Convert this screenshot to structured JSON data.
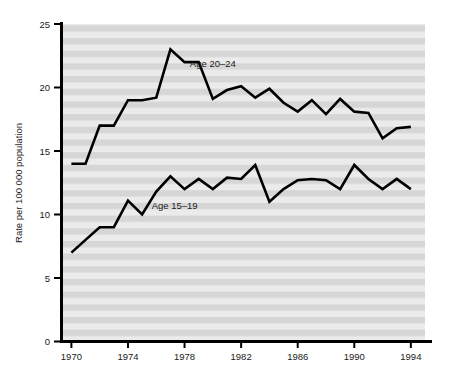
{
  "chart_data": {
    "type": "line",
    "title": "",
    "xlabel": "",
    "ylabel": "Rate per 100 000 population",
    "xlim": [
      1969.3,
      1995.0
    ],
    "ylim": [
      0,
      25
    ],
    "xticks": [
      1970,
      1974,
      1978,
      1982,
      1986,
      1990,
      1994
    ],
    "xtick_labels": [
      "1970",
      "1974",
      "1978",
      "1982",
      "1986",
      "1990",
      "1994"
    ],
    "yticks": [
      0,
      5,
      10,
      15,
      20,
      25
    ],
    "ytick_labels": [
      "0",
      "5",
      "10",
      "15",
      "20",
      "25"
    ],
    "grid": false,
    "background_stripes": true,
    "legend_position": "inline-annotation",
    "x": [
      1970,
      1971,
      1972,
      1973,
      1974,
      1975,
      1976,
      1977,
      1978,
      1979,
      1980,
      1981,
      1982,
      1983,
      1984,
      1985,
      1986,
      1987,
      1988,
      1989,
      1990,
      1991,
      1992,
      1993,
      1994
    ],
    "series": [
      {
        "name": "Age 20–24",
        "label": "Age 20–24",
        "color": "#000000",
        "label_x": 1980.0,
        "label_y": 21.6,
        "values": [
          14.0,
          14.0,
          17.0,
          17.0,
          19.0,
          19.0,
          19.2,
          23.0,
          22.0,
          22.0,
          19.1,
          19.8,
          20.1,
          19.2,
          19.9,
          18.8,
          18.1,
          19.0,
          17.9,
          19.1,
          18.1,
          18.0,
          16.0,
          16.8,
          16.9
        ]
      },
      {
        "name": "Age 15–19",
        "label": "Age 15–19",
        "color": "#000000",
        "label_x": 1977.3,
        "label_y": 10.4,
        "values": [
          7.0,
          8.0,
          9.0,
          9.0,
          11.1,
          10.0,
          11.8,
          13.0,
          12.0,
          12.8,
          12.0,
          12.9,
          12.8,
          13.9,
          11.0,
          12.0,
          12.7,
          12.8,
          12.7,
          12.0,
          13.9,
          12.8,
          12.0,
          12.8,
          12.0
        ]
      }
    ]
  },
  "figure": {
    "plot_bg_light": "#ebebeb",
    "plot_bg_dark": "#d6d6d6",
    "axis_color": "#000000",
    "line_color": "#000000"
  }
}
